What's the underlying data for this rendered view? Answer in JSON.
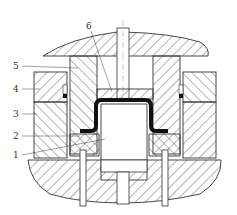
{
  "diagram": {
    "type": "mechanical-cross-section",
    "labels": [
      {
        "id": "1",
        "text": "1"
      },
      {
        "id": "2",
        "text": "2"
      },
      {
        "id": "3",
        "text": "3"
      },
      {
        "id": "4",
        "text": "4"
      },
      {
        "id": "5",
        "text": "5"
      },
      {
        "id": "6",
        "text": "6"
      }
    ],
    "colors": {
      "line": "#333333",
      "workpiece": "#111111",
      "background": "#ffffff"
    }
  }
}
